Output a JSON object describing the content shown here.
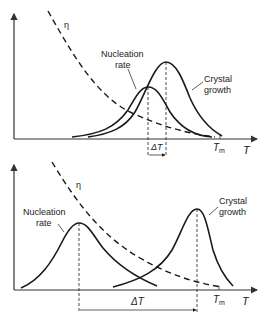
{
  "figure": {
    "panels": [
      {
        "id": "top",
        "description": "Nucleation rate and crystal growth curves overlap closely (small undercooling gap)",
        "labels": {
          "viscosity": "η",
          "nucleation_line1": "Nucleation",
          "nucleation_line2": "rate",
          "growth_line1": "Crystal",
          "growth_line2": "growth",
          "delta_t": "ΔT",
          "tm_main": "T",
          "tm_sub": "m",
          "x_axis": "T"
        }
      },
      {
        "id": "bottom",
        "description": "Nucleation rate and crystal growth curves widely separated (large undercooling gap)",
        "labels": {
          "viscosity": "η",
          "nucleation_line1": "Nucleation",
          "nucleation_line2": "rate",
          "growth_line1": "Crystal",
          "growth_line2": "growth",
          "delta_t": "ΔT",
          "tm_main": "T",
          "tm_sub": "m",
          "x_axis": "T"
        }
      }
    ],
    "colors": {
      "line": "#1a1a1a",
      "axis": "#333333",
      "background": "#ffffff"
    }
  }
}
